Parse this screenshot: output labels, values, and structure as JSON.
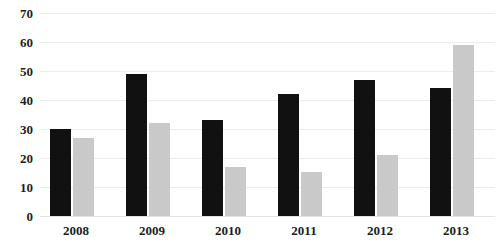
{
  "chart": {
    "title": "",
    "title_visible": false
  },
  "chart_data": {
    "type": "bar",
    "title": "",
    "subtitle": "",
    "xlabel": "",
    "ylabel": "",
    "categories": [
      "2008",
      "2009",
      "2010",
      "2011",
      "2012",
      "2013"
    ],
    "series": [
      {
        "name": "Series 1",
        "color": "#111111",
        "values": [
          30,
          49,
          33,
          42,
          47,
          44
        ]
      },
      {
        "name": "Series 2",
        "color": "#c9c9c9",
        "values": [
          27,
          32,
          17,
          15,
          21,
          59
        ]
      }
    ],
    "ylim": [
      0,
      70
    ],
    "ytick_values": [
      70,
      60,
      50,
      40,
      30,
      20,
      10,
      0
    ],
    "ytick_labels": [
      "70",
      "60",
      "50",
      "40",
      "30",
      "20",
      "10",
      "0"
    ],
    "grid": true,
    "grid_axis": "y",
    "legend": false,
    "legend_position": "none",
    "annotations": [],
    "colors": {
      "series_1": "#111111",
      "series_2": "#c9c9c9",
      "gridline": "#ececed",
      "text": "#1c1c1c",
      "background": "#ffffff"
    }
  }
}
